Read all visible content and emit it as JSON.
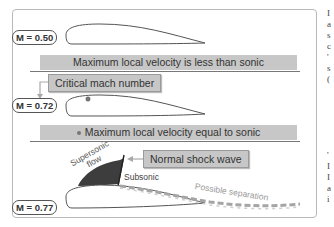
{
  "diagram": {
    "rows": [
      {
        "mach_label": "M = 0.50",
        "banner": "Maximum local velocity is less than sonic"
      },
      {
        "mach_label": "M = 0.72",
        "callout": "Critical mach number",
        "banner": "Maximum local velocity equal to sonic"
      },
      {
        "mach_label": "M = 0.77",
        "callout": "Normal shock wave"
      }
    ],
    "annotations": {
      "supersonic_line1": "Supersonic",
      "supersonic_line2": "flow",
      "subsonic": "Subsonic",
      "separation": "Possible separation"
    },
    "colors": {
      "banner_fill": "#c7c7c7",
      "supersonic_region": "#3d3d3d",
      "frame_border": "#b9b9b9",
      "arrow": "#a9a9a9"
    }
  },
  "right_edge_text": {
    "top_chars": [
      "I",
      "a",
      "s",
      "c",
      "'",
      "s",
      "("
    ],
    "bottom_chars": [
      "'",
      "I",
      "I",
      "a",
      "i"
    ]
  }
}
